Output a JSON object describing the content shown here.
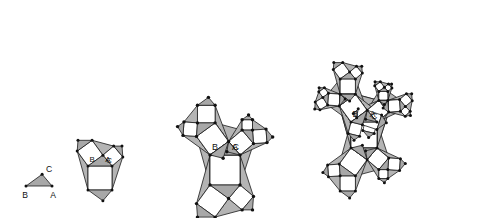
{
  "figure": {
    "background_color": "#ffffff",
    "stroke_color": "#1a1a1a",
    "square_fill": "#ffffff",
    "triangle_fill": "#a8a8a8",
    "gap_fill": "#b4b4b4",
    "vertex_color": "#111111",
    "canvas": {
      "width": 480,
      "height": 218
    }
  },
  "labels": {
    "a": "A",
    "b": "B",
    "c": "C"
  },
  "chart_data": {
    "type": "diagram",
    "iterations": [
      {
        "index": 0,
        "label": "stage-0",
        "depth": 0,
        "squares": 0,
        "triangles": 1
      },
      {
        "index": 1,
        "label": "stage-1",
        "depth": 1,
        "squares": 3,
        "triangles": 4
      },
      {
        "index": 2,
        "label": "stage-2",
        "depth": 2,
        "squares": 12,
        "triangles": 13
      },
      {
        "index": 3,
        "label": "stage-3",
        "depth": 3,
        "squares": 39,
        "triangles": 40
      }
    ],
    "seed_triangle": {
      "vertex_b": [
        0,
        0
      ],
      "vertex_a": [
        1,
        0
      ],
      "vertex_c": [
        0.62,
        0.45
      ],
      "note": "unit base BA, apex C above and right of centre"
    },
    "placements": [
      {
        "stage": 0,
        "base_x": 26,
        "base_y": 186,
        "scale": 26,
        "depth": 0
      },
      {
        "stage": 1,
        "base_x": 88,
        "base_y": 166,
        "scale": 24,
        "depth": 1
      },
      {
        "stage": 2,
        "base_x": 210,
        "base_y": 155,
        "scale": 30,
        "depth": 2
      },
      {
        "stage": 3,
        "base_x": 351,
        "base_y": 122,
        "scale": 26,
        "depth": 3
      }
    ]
  }
}
